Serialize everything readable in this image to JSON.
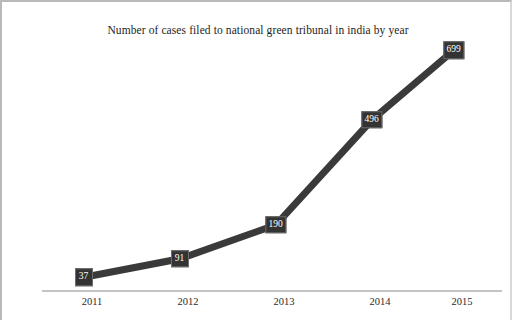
{
  "chart_data": {
    "type": "line",
    "title": "Number of cases filed to national green tribunal in india by year",
    "xlabel": "",
    "ylabel": "",
    "categories": [
      "2011",
      "2012",
      "2013",
      "2014",
      "2015"
    ],
    "values": [
      37,
      91,
      190,
      496,
      699
    ],
    "data_labels": [
      "37",
      "91",
      "190",
      "496",
      "699"
    ],
    "ylim": [
      0,
      740
    ],
    "grid": false,
    "legend": false,
    "legend_position": "none",
    "series": [
      {
        "name": "Cases filed",
        "values": [
          37,
          91,
          190,
          496,
          699
        ]
      }
    ],
    "colors": {
      "line": "#3a3a3a",
      "marker_fill": "#333333",
      "marker_border": "#6e6e6e",
      "marker_text": "#ffffff",
      "axis": "#c4c4c4",
      "frame": "#b9b9b9",
      "title_text": "#1d1d1d",
      "tick_text": "#2a2a2a",
      "background": "#ffffff"
    }
  }
}
